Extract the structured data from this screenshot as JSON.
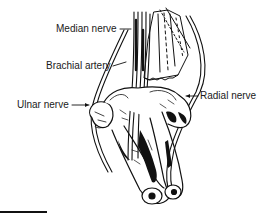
{
  "figure": {
    "labels": {
      "median_nerve": "Median nerve",
      "brachial_artery": "Brachial artery",
      "ulnar_nerve": "Ulnar nerve",
      "radial_nerve": "Radial nerve"
    },
    "colors": {
      "ink": "#111111",
      "background": "#ffffff"
    }
  }
}
